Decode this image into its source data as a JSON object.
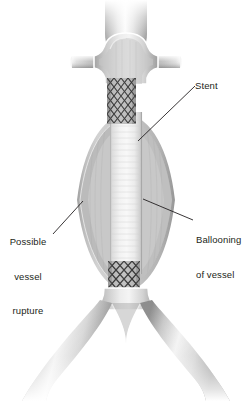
{
  "figure": {
    "type": "medical-illustration",
    "background_color": "#ffffff",
    "line_color": "#231f20",
    "anatomy": {
      "aorta_label": "aorta",
      "renal_arteries_label": "renal arteries",
      "iliac_arteries_label": "iliac arteries",
      "aneurysm_sac_label": "aneurysm sac",
      "graft_tube_label": "stent graft tube"
    },
    "shading": {
      "vessel_mid_gray": "#b9b9b9",
      "vessel_dark_gray": "#8f8f8f",
      "sac_fill_gray": "#c6c6c6",
      "graft_light": "#eeeeee",
      "outline_white": "#ffffff",
      "stent_mesh": "#1a1a1a"
    }
  },
  "labels": {
    "stent": {
      "text": "Stent",
      "lines": [
        "Stent"
      ],
      "align": "left",
      "leader_from": [
        195,
        86
      ],
      "leader_to": [
        138,
        141
      ]
    },
    "ballooning": {
      "text": "Ballooning of vessel",
      "lines": [
        "Ballooning",
        "of vessel"
      ],
      "align": "left",
      "leader_from": [
        193,
        220
      ],
      "leader_to": [
        143,
        199
      ]
    },
    "rupture": {
      "text": "Possible vessel rupture",
      "lines": [
        "Possible",
        "vessel",
        "rupture"
      ],
      "align": "center",
      "leader_from": [
        53,
        234
      ],
      "leader_to": [
        83,
        201
      ]
    }
  },
  "stents": {
    "upper": {
      "x": 107,
      "y": 78,
      "width": 29,
      "height": 46,
      "columns": 4,
      "rows": 5
    },
    "lower": {
      "x": 108,
      "y": 261,
      "width": 32,
      "height": 36,
      "columns": 4,
      "rows": 4
    }
  }
}
